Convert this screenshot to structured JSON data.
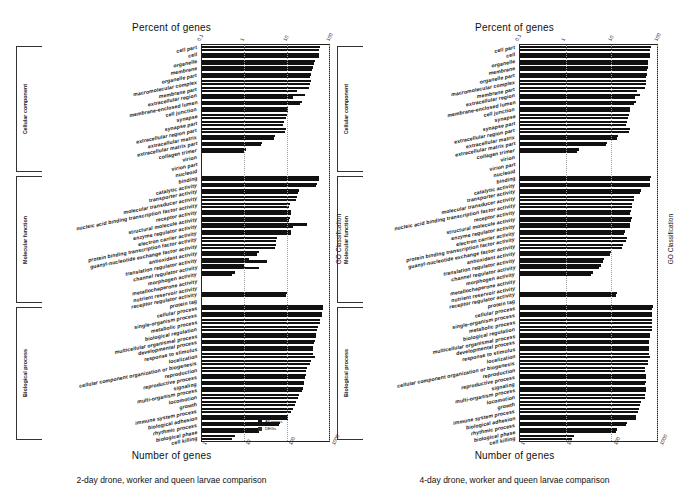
{
  "figure": {
    "top_axis_title": "Percent of genes",
    "bottom_axis_title": "Number of genes",
    "right_axis_title": "GO Classification"
  },
  "legend": {
    "items": [
      {
        "label": "All genes"
      },
      {
        "label": "DEGs"
      }
    ]
  },
  "panels": [
    {
      "id": "panel-2day",
      "caption": "2-day drone, worker and queen larvae comparison",
      "top_ticks": [
        "0.1",
        "1",
        "10",
        "100"
      ],
      "bottom_ticks": [
        "1",
        "10",
        "100",
        "1000"
      ],
      "groups": [
        {
          "name": "Cellular component"
        },
        {
          "name": "Molecular function"
        },
        {
          "name": "Biological process"
        }
      ]
    },
    {
      "id": "panel-4day",
      "caption": "4-day drone, worker and queen larvae comparison",
      "top_ticks": [
        "0.1",
        "1",
        "10",
        "100"
      ],
      "bottom_ticks": [
        "1",
        "10",
        "100",
        "1000"
      ],
      "groups": [
        {
          "name": "Cellular component"
        },
        {
          "name": "Molecular function"
        },
        {
          "name": "Biological process"
        }
      ]
    }
  ],
  "chart_data": [
    {
      "type": "bar",
      "title": "2-day drone, worker and queen larvae comparison",
      "orientation": "horizontal",
      "xlabel": "Number of genes",
      "xlabel_top": "Percent of genes",
      "ylabel": "GO Classification",
      "xscale": "log",
      "xlim_percent": [
        0.1,
        100
      ],
      "xlim_count": [
        1,
        1000
      ],
      "grid": true,
      "legend_position": "bottom-right",
      "groups": [
        {
          "name": "Cellular component",
          "categories": [
            "cell part",
            "cell",
            "organelle",
            "membrane",
            "organelle part",
            "macromolecular complex",
            "membrane part",
            "extracellular region",
            "membrane-enclosed lumen",
            "cell junction",
            "synapse",
            "synapse part",
            "extracellular region part",
            "extracellular matrix",
            "extracellular matrix part",
            "collagen trimer",
            "virion",
            "virion part",
            "nucleoid"
          ],
          "series": [
            {
              "name": "All genes",
              "values": [
                60.0,
                58.0,
                46.0,
                41.0,
                38.0,
                37.0,
                34.0,
                27.0,
                23.0,
                11.0,
                10.0,
                8.5,
                9.5,
                5.2,
                2.6,
                1.1,
                0.0,
                0.0,
                0.0
              ]
            },
            {
              "name": "DEGs",
              "values": [
                59.0,
                57.0,
                44.0,
                39.0,
                36.0,
                35.0,
                18.0,
                14.0,
                21.0,
                10.5,
                9.6,
                8.0,
                9.0,
                5.0,
                2.5,
                1.0,
                0.0,
                0.0,
                0.0
              ]
            }
          ]
        },
        {
          "name": "Molecular function",
          "categories": [
            "binding",
            "catalytic activity",
            "transporter activity",
            "molecular transducer activity",
            "nucleic acid binding transcription factor activity",
            "receptor activity",
            "structural molecule activity",
            "enzyme regulator activity",
            "electron carrier activity",
            "protein binding transcription factor activity",
            "guanyl-nucleotide exchange factor activity",
            "antioxidant activity",
            "translation regulator activity",
            "channel regulator activity",
            "morphogen activity",
            "metallochaperone activity",
            "nutrient reservoir activity",
            "receptor regulator activity",
            "protein tag"
          ],
          "series": [
            {
              "name": "All genes",
              "values": [
                58.0,
                52.0,
                20.0,
                18.0,
                12.0,
                13.0,
                12.0,
                30.0,
                13.0,
                5.8,
                5.5,
                2.2,
                1.3,
                1.0,
                0.6,
                0.0,
                0.0,
                10.0,
                0.0
              ]
            },
            {
              "name": "DEGs",
              "values": [
                57.0,
                50.0,
                19.0,
                17.0,
                11.5,
                12.5,
                11.5,
                14.0,
                12.5,
                5.5,
                5.2,
                2.0,
                3.5,
                2.2,
                0.5,
                0.0,
                0.0,
                9.5,
                0.0
              ]
            }
          ]
        },
        {
          "name": "Biological process",
          "categories": [
            "cellular process",
            "single-organism process",
            "metabolic process",
            "biological regulation",
            "multicellular organismal process",
            "developmental process",
            "response to stimulus",
            "localization",
            "cellular component organization or biogenesis",
            "reproduction",
            "reproductive process",
            "signaling",
            "multi-organism process",
            "locomotion",
            "growth",
            "immune system process",
            "biological adhesion",
            "rhythmic process",
            "biological phase",
            "cell killing"
          ],
          "series": [
            {
              "name": "All genes",
              "values": [
                72.0,
                68.0,
                62.0,
                55.0,
                50.0,
                46.0,
                43.0,
                42.0,
                38.0,
                30.0,
                28.0,
                26.0,
                24.0,
                20.0,
                17.0,
                14.0,
                11.0,
                7.0,
                2.4,
                0.6
              ]
            },
            {
              "name": "DEGs",
              "values": [
                71.0,
                67.0,
                61.0,
                53.0,
                48.0,
                44.0,
                41.0,
                47.0,
                36.0,
                29.0,
                27.0,
                25.0,
                23.0,
                19.0,
                16.0,
                13.0,
                10.5,
                6.5,
                2.2,
                0.5
              ]
            }
          ]
        }
      ]
    },
    {
      "type": "bar",
      "title": "4-day drone, worker and queen larvae comparison",
      "orientation": "horizontal",
      "xlabel": "Number of genes",
      "xlabel_top": "Percent of genes",
      "ylabel": "GO Classification",
      "xscale": "log",
      "xlim_percent": [
        0.1,
        100
      ],
      "xlim_count": [
        1,
        1000
      ],
      "grid": true,
      "legend_position": "none",
      "groups": [
        {
          "name": "Cellular component",
          "categories": [
            "cell part",
            "cell",
            "organelle",
            "membrane",
            "organelle part",
            "macromolecular complex",
            "membrane part",
            "extracellular region",
            "membrane-enclosed lumen",
            "cell junction",
            "synapse",
            "synapse part",
            "extracellular region part",
            "extracellular matrix",
            "extracellular matrix part",
            "collagen trimer",
            "virion",
            "virion part",
            "nucleoid"
          ],
          "series": [
            {
              "name": "All genes",
              "values": [
                74.0,
                72.0,
                64.0,
                62.0,
                60.0,
                58.0,
                55.0,
                42.0,
                34.0,
                26.0,
                24.0,
                22.0,
                25.0,
                14.0,
                8.0,
                2.0,
                0.0,
                0.0,
                0.0
              ]
            },
            {
              "name": "DEGs",
              "values": [
                72.0,
                70.0,
                62.0,
                60.0,
                58.0,
                56.0,
                37.0,
                33.0,
                32.0,
                25.0,
                23.0,
                21.0,
                24.0,
                13.0,
                7.5,
                1.8,
                0.0,
                0.0,
                0.0
              ]
            }
          ]
        },
        {
          "name": "Molecular function",
          "categories": [
            "binding",
            "catalytic activity",
            "transporter activity",
            "molecular transducer activity",
            "nucleic acid binding transcription factor activity",
            "receptor activity",
            "structural molecule activity",
            "enzyme regulator activity",
            "electron carrier activity",
            "protein binding transcription factor activity",
            "guanyl-nucleotide exchange factor activity",
            "antioxidant activity",
            "translation regulator activity",
            "channel regulator activity",
            "morphogen activity",
            "metallochaperone activity",
            "nutrient reservoir activity",
            "receptor regulator activity",
            "protein tag"
          ],
          "series": [
            {
              "name": "All genes",
              "values": [
                73.0,
                72.0,
                45.0,
                32.0,
                29.0,
                27.0,
                28.0,
                26.0,
                20.0,
                22.0,
                18.0,
                10.0,
                7.0,
                6.0,
                4.0,
                0.0,
                0.0,
                13.0,
                0.0
              ]
            },
            {
              "name": "DEGs",
              "values": [
                72.0,
                71.0,
                43.0,
                31.0,
                28.0,
                26.0,
                27.0,
                25.0,
                19.0,
                21.0,
                17.0,
                9.5,
                6.5,
                5.5,
                3.5,
                0.0,
                0.0,
                12.5,
                0.0
              ]
            }
          ]
        },
        {
          "name": "Biological process",
          "categories": [
            "cellular process",
            "single-organism process",
            "metabolic process",
            "biological regulation",
            "multicellular organismal process",
            "developmental process",
            "response to stimulus",
            "localization",
            "cellular component organization or biogenesis",
            "reproduction",
            "reproductive process",
            "signaling",
            "multi-organism process",
            "locomotion",
            "growth",
            "immune system process",
            "biological adhesion",
            "rhythmic process",
            "biological phase",
            "cell killing"
          ],
          "series": [
            {
              "name": "All genes",
              "values": [
                80.0,
                79.0,
                78.0,
                78.0,
                70.0,
                68.0,
                67.0,
                66.0,
                64.0,
                55.0,
                58.0,
                56.0,
                57.0,
                55.0,
                44.0,
                40.0,
                35.0,
                22.0,
                13.0,
                1.5
              ]
            },
            {
              "name": "DEGs",
              "values": [
                79.0,
                78.0,
                77.0,
                77.0,
                69.0,
                67.0,
                66.0,
                71.0,
                63.0,
                54.0,
                57.0,
                55.0,
                56.0,
                54.0,
                43.0,
                39.0,
                34.0,
                21.0,
                12.5,
                1.4
              ]
            }
          ]
        }
      ]
    }
  ]
}
